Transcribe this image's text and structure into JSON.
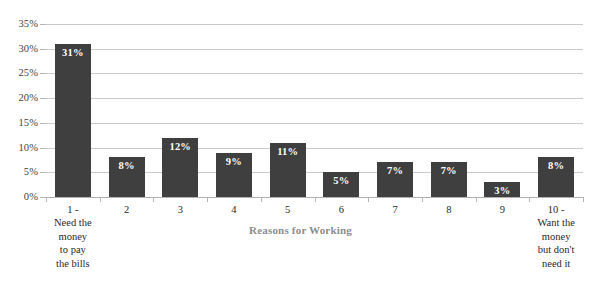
{
  "chart_data": {
    "type": "bar",
    "title": "",
    "xlabel": "Reasons for Working",
    "ylabel": "",
    "ylim": [
      0,
      35
    ],
    "ytick_step": 5,
    "grid": true,
    "legend": false,
    "bar_color": "#3f3f3f",
    "gridline_color": "#c9c9c9",
    "categories": [
      "1 -\nNeed the\nmoney\nto pay\nthe bills",
      "2",
      "3",
      "4",
      "5",
      "6",
      "7",
      "8",
      "9",
      "10 -\nWant the\nmoney\nbut don't\nneed it"
    ],
    "values": [
      31,
      8,
      12,
      9,
      11,
      5,
      7,
      7,
      3,
      8
    ],
    "data_labels": [
      "31%",
      "8%",
      "12%",
      "9%",
      "11%",
      "5%",
      "7%",
      "7%",
      "3%",
      "8%"
    ],
    "ytick_labels": [
      "0%",
      "5%",
      "10%",
      "15%",
      "20%",
      "25%",
      "30%",
      "35%"
    ],
    "ytick_values": [
      0,
      5,
      10,
      15,
      20,
      25,
      30,
      35
    ]
  }
}
